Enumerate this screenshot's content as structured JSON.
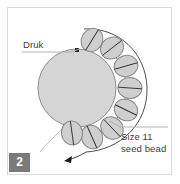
{
  "figure": {
    "step_number": "2",
    "labels": {
      "druk": "Druk",
      "seed_bead_line1": "Size 11",
      "seed_bead_line2": "seed bead"
    },
    "colors": {
      "bead_fill": "#d5d5d5",
      "bead_stroke": "#8c8c8c",
      "seed_fill": "#cfcfcf",
      "seed_stroke": "#8a8a8a",
      "thread": "#2e2e2e",
      "thread_light": "#b9b9b9",
      "leader_line": "#b0b0b0",
      "frame": "#d9d9d9",
      "badge_bg": "#7a7a7a",
      "badge_text": "#ffffff",
      "text": "#3d3d3d"
    },
    "icons": {
      "druk_hole": "bead-hole-marker",
      "thread_end": "thread-arrow-tip"
    },
    "druk_bead": {
      "cx": 77,
      "cy": 88,
      "r": 39
    },
    "seed_beads": [
      {
        "cx": 92,
        "cy": 40,
        "rx": 12,
        "ry": 10.5,
        "rot": -58
      },
      {
        "cx": 112,
        "cy": 48,
        "rx": 12,
        "ry": 10.5,
        "rot": -38
      },
      {
        "cx": 126,
        "cy": 66,
        "rx": 12,
        "ry": 10.5,
        "rot": -16
      },
      {
        "cx": 130,
        "cy": 88,
        "rx": 12,
        "ry": 10.5,
        "rot": 4
      },
      {
        "cx": 126,
        "cy": 110,
        "rx": 12,
        "ry": 10.5,
        "rot": 26
      },
      {
        "cx": 112,
        "cy": 128,
        "rx": 12,
        "ry": 10.5,
        "rot": 46
      },
      {
        "cx": 92,
        "cy": 137,
        "rx": 12,
        "ry": 10.5,
        "rot": 66
      },
      {
        "cx": 72,
        "cy": 133,
        "rx": 12,
        "ry": 10.5,
        "rot": 82
      }
    ],
    "seed_bead_count": 8
  }
}
